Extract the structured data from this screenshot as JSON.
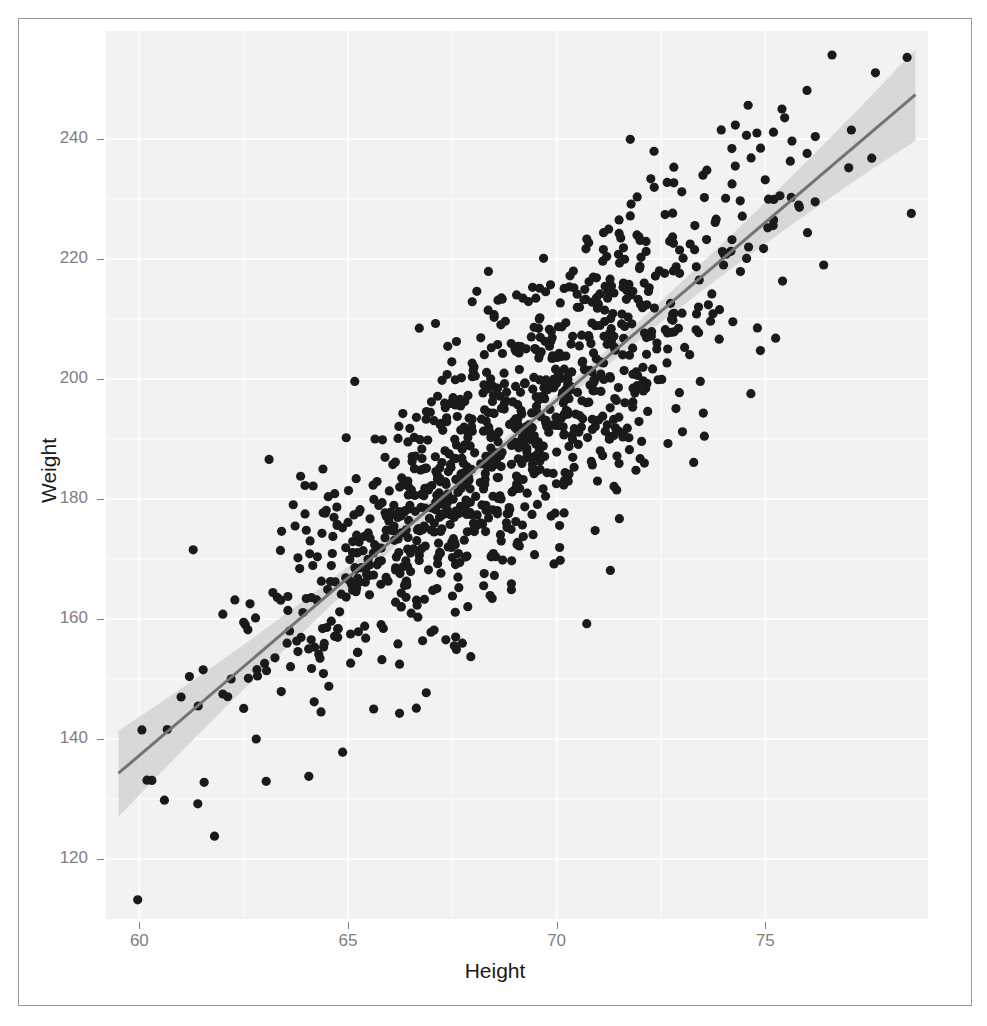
{
  "figure": {
    "background": "#ffffff",
    "panel_background": "#f2f2f2",
    "frame_border_color": "#9a9a9a",
    "axis_text_color": "#7f7f7f",
    "axis_title_color": "#1a1a1a",
    "point_color": "#1a1a1a",
    "line_color": "#737373",
    "ribbon_color": "#d4d4d4"
  },
  "chart_data": {
    "type": "scatter",
    "title": "",
    "subtitle": "",
    "xlabel": "Height",
    "ylabel": "Weight",
    "xlim": [
      59.2,
      78.9
    ],
    "ylim": [
      110,
      258
    ],
    "xticks": [
      60,
      65,
      70,
      75
    ],
    "yticks": [
      120,
      140,
      160,
      180,
      200,
      220,
      240
    ],
    "xtick_labels": [
      "60",
      "65",
      "70",
      "75"
    ],
    "ytick_labels": [
      "120",
      "140",
      "160",
      "180",
      "200",
      "220",
      "240"
    ],
    "grid": true,
    "grid_color": "#ffffff",
    "legend": null,
    "legend_position": "none",
    "n_points": 1000,
    "marker": "filled-circle",
    "marker_size": 4.6,
    "smoother": {
      "name": "linear-regression",
      "method": "lm",
      "show_confidence_interval": true,
      "confidence_level": 0.95,
      "intercept": -218.0,
      "slope": 5.92,
      "x_start": 59.5,
      "x_end": 78.6,
      "y_start": 134.3,
      "y_end": 247.4,
      "se_min": 0.95,
      "se_max": 7.4,
      "se_center_x": 68.9
    },
    "series": [
      {
        "name": "observations",
        "x_mean": 68.9,
        "y_mean": 189.9,
        "x_sd": 2.95,
        "y_sd": 20.9,
        "correlation": 0.835,
        "sample_points": [
          [
            59.96,
            113.2
          ],
          [
            60.3,
            133.1
          ],
          [
            60.6,
            129.8
          ],
          [
            61.0,
            147.0
          ],
          [
            61.2,
            150.4
          ],
          [
            61.4,
            129.2
          ],
          [
            61.8,
            123.8
          ],
          [
            62.0,
            147.5
          ],
          [
            62.0,
            160.8
          ],
          [
            62.2,
            150.0
          ],
          [
            62.5,
            145.1
          ],
          [
            62.6,
            158.2
          ],
          [
            62.8,
            140.0
          ],
          [
            63.0,
            152.6
          ],
          [
            63.2,
            164.4
          ],
          [
            63.4,
            147.9
          ],
          [
            63.6,
            158.0
          ],
          [
            63.8,
            170.2
          ],
          [
            64.0,
            163.4
          ],
          [
            64.2,
            155.3
          ],
          [
            64.4,
            185.0
          ],
          [
            64.6,
            168.9
          ],
          [
            64.8,
            161.2
          ],
          [
            65.0,
            176.1
          ],
          [
            65.2,
            171.0
          ],
          [
            65.4,
            158.8
          ],
          [
            65.6,
            182.3
          ],
          [
            65.8,
            169.7
          ],
          [
            66.0,
            174.8
          ],
          [
            66.2,
            190.1
          ],
          [
            66.4,
            166.3
          ],
          [
            66.6,
            180.6
          ],
          [
            66.8,
            175.0
          ],
          [
            67.0,
            196.2
          ],
          [
            67.2,
            183.4
          ],
          [
            67.4,
            172.0
          ],
          [
            67.6,
            189.0
          ],
          [
            67.8,
            178.5
          ],
          [
            68.0,
            201.4
          ],
          [
            68.2,
            193.3
          ],
          [
            68.4,
            186.0
          ],
          [
            68.6,
            180.1
          ],
          [
            68.8,
            197.8
          ],
          [
            69.0,
            205.0
          ],
          [
            69.2,
            191.6
          ],
          [
            69.4,
            186.9
          ],
          [
            69.6,
            210.2
          ],
          [
            69.8,
            199.4
          ],
          [
            70.0,
            203.7
          ],
          [
            70.2,
            194.1
          ],
          [
            70.4,
            218.0
          ],
          [
            70.6,
            207.3
          ],
          [
            70.8,
            199.0
          ],
          [
            71.0,
            212.5
          ],
          [
            71.2,
            220.4
          ],
          [
            71.4,
            204.8
          ],
          [
            71.6,
            216.0
          ],
          [
            71.8,
            209.2
          ],
          [
            72.0,
            223.1
          ],
          [
            72.2,
            214.6
          ],
          [
            72.4,
            205.0
          ],
          [
            72.6,
            227.4
          ],
          [
            72.8,
            218.0
          ],
          [
            73.0,
            231.2
          ],
          [
            73.2,
            222.5
          ],
          [
            73.4,
            212.0
          ],
          [
            73.6,
            234.8
          ],
          [
            73.8,
            226.1
          ],
          [
            74.0,
            219.0
          ],
          [
            74.2,
            238.4
          ],
          [
            74.4,
            229.7
          ],
          [
            74.6,
            222.0
          ],
          [
            74.8,
            241.0
          ],
          [
            75.0,
            233.2
          ],
          [
            75.2,
            226.5
          ],
          [
            75.4,
            245.0
          ],
          [
            75.6,
            236.3
          ],
          [
            75.8,
            229.0
          ],
          [
            76.0,
            248.1
          ],
          [
            76.2,
            240.4
          ],
          [
            76.4,
            219.0
          ],
          [
            76.6,
            254.0
          ],
          [
            77.0,
            235.2
          ],
          [
            78.4,
            253.6
          ],
          [
            78.5,
            227.6
          ]
        ]
      }
    ]
  }
}
